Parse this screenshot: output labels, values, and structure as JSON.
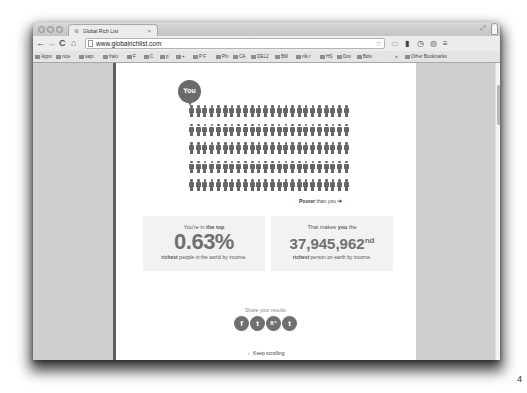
{
  "browser": {
    "tab_title": "Global Rich List",
    "tab_favicon": "wifi-icon",
    "url": "www.globalrichlist.com",
    "nav": {
      "back": "←",
      "forward": "→",
      "reload": "C",
      "home": "⌂"
    },
    "bookmarks": [
      "Apps",
      "nice",
      "sapt",
      "fralo",
      "F",
      "C",
      "p",
      "+",
      "P F",
      "Pin",
      "CA",
      "DEL2",
      "BM",
      "nlk.r",
      "HS",
      "Dox",
      "Bdiv",
      "»",
      "Other Bookmarks"
    ]
  },
  "main": {
    "you_label": "You",
    "people_grid": {
      "rows": 5,
      "columns": 24
    },
    "poorer_label_bold": "Poorer",
    "poorer_label_rest": " than you",
    "poorer_arrow": "➔",
    "stat_top": {
      "lead_plain": "You're in ",
      "lead_bold": "the top",
      "value": "0.63%",
      "sub_bold": "richest",
      "sub_rest": " people in the world by income."
    },
    "stat_rank": {
      "lead_plain": "That makes ",
      "lead_bold": "you",
      "lead_end": " the",
      "value": "37,945,962",
      "suffix": "nd",
      "sub_bold": "richest",
      "sub_rest": " person on earth by income."
    },
    "share_label": "Share your results:",
    "share_buttons": [
      {
        "name": "facebook",
        "glyph": "f"
      },
      {
        "name": "twitter",
        "glyph": "t"
      },
      {
        "name": "google-plus",
        "glyph": "8⁺"
      },
      {
        "name": "tumblr",
        "glyph": "t"
      }
    ],
    "keep_scrolling": "Keep scrolling",
    "keep_arrow": "↓"
  },
  "page_number": "4"
}
